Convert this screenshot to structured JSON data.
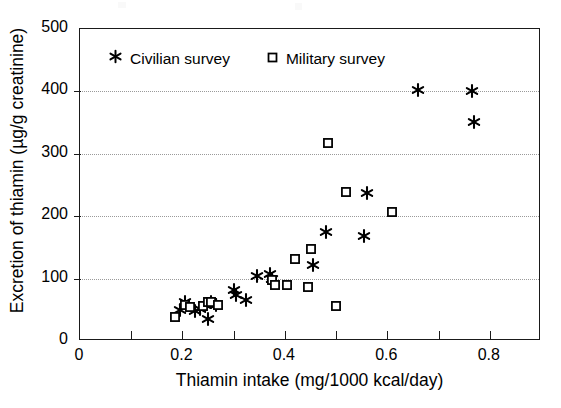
{
  "chart_data": {
    "type": "scatter",
    "title": "",
    "xlabel": "Thiamin intake (mg/1000 kcal/day)",
    "ylabel": "Excretion of thiamin (µg/g creatinine)",
    "xlim": [
      0,
      0.9
    ],
    "ylim": [
      0,
      500
    ],
    "xticks": [
      0,
      0.2,
      0.4,
      0.6,
      0.8
    ],
    "xtick_labels": [
      "0",
      "0.2",
      "0.4",
      "0.6",
      "0.8"
    ],
    "xminor_ticks": [
      0.1,
      0.3,
      0.5,
      0.7
    ],
    "yticks": [
      0,
      100,
      200,
      300,
      400,
      500
    ],
    "ytick_labels": [
      "0",
      "100",
      "200",
      "300",
      "400",
      "500"
    ],
    "grid": "horizontal-dotted",
    "legend_position": "top-left-inside",
    "series": [
      {
        "name": "Civilian survey",
        "marker": "asterisk",
        "color": "#000000",
        "points": [
          [
            0.195,
            50
          ],
          [
            0.205,
            62
          ],
          [
            0.225,
            48
          ],
          [
            0.235,
            52
          ],
          [
            0.245,
            57
          ],
          [
            0.25,
            36
          ],
          [
            0.255,
            62
          ],
          [
            0.265,
            58
          ],
          [
            0.3,
            82
          ],
          [
            0.305,
            74
          ],
          [
            0.325,
            66
          ],
          [
            0.345,
            104
          ],
          [
            0.37,
            107
          ],
          [
            0.375,
            100
          ],
          [
            0.455,
            121
          ],
          [
            0.48,
            174
          ],
          [
            0.555,
            169
          ],
          [
            0.56,
            237
          ],
          [
            0.66,
            402
          ],
          [
            0.765,
            400
          ],
          [
            0.77,
            351
          ]
        ]
      },
      {
        "name": "Military survey",
        "marker": "open-square",
        "color": "#000000",
        "points": [
          [
            0.185,
            38
          ],
          [
            0.205,
            57
          ],
          [
            0.215,
            55
          ],
          [
            0.24,
            56
          ],
          [
            0.25,
            62
          ],
          [
            0.255,
            63
          ],
          [
            0.27,
            58
          ],
          [
            0.375,
            97
          ],
          [
            0.38,
            89
          ],
          [
            0.405,
            89
          ],
          [
            0.42,
            132
          ],
          [
            0.445,
            86
          ],
          [
            0.45,
            148
          ],
          [
            0.485,
            318
          ],
          [
            0.5,
            56
          ],
          [
            0.52,
            238
          ],
          [
            0.61,
            207
          ]
        ]
      }
    ]
  },
  "legend": {
    "entries": [
      {
        "label": "Civilian survey",
        "marker": "asterisk"
      },
      {
        "label": "Military survey",
        "marker": "open-square"
      }
    ]
  }
}
